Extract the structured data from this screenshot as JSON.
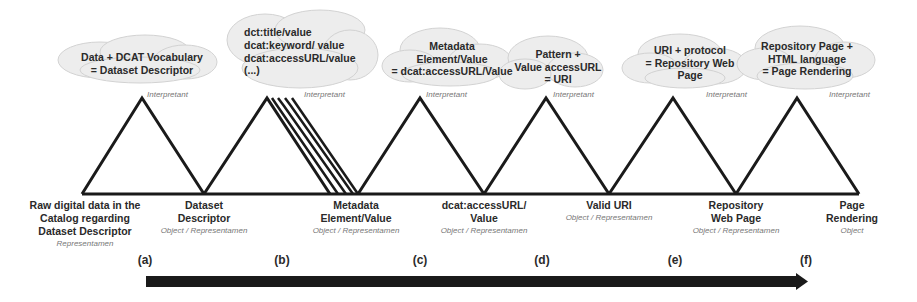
{
  "diagram": {
    "type": "semiotic-chain",
    "interpretant_label": "Interpretant",
    "clouds": [
      {
        "id": "a",
        "lines": [
          "Data + DCAT Vocabulary",
          "= Dataset Descriptor"
        ]
      },
      {
        "id": "b",
        "lines": [
          "dct:title/value",
          "dcat:keyword/ value",
          "dcat:accessURL/value",
          " (...)"
        ]
      },
      {
        "id": "c",
        "lines": [
          "Metadata",
          "Element/Value",
          "= dcat:accessURL/Value"
        ]
      },
      {
        "id": "d",
        "lines": [
          "Pattern +",
          "Value accessURL",
          "= URI"
        ]
      },
      {
        "id": "e",
        "lines": [
          "URI + protocol",
          "= Repository Web",
          "Page"
        ]
      },
      {
        "id": "f",
        "lines": [
          "Repository Page +",
          "HTML language",
          "= Page Rendering"
        ]
      }
    ],
    "nodes": [
      {
        "lines": [
          "Raw digital data in the",
          "Catalog regarding",
          "Dataset Descriptor"
        ],
        "role": "Representamen"
      },
      {
        "lines": [
          "Dataset",
          "Descriptor"
        ],
        "role": "Object / Representamen"
      },
      {
        "lines": [
          "Metadata",
          "Element/Value"
        ],
        "role": "Object / Representamen"
      },
      {
        "lines": [
          "dcat:accessURL/",
          "Value"
        ],
        "role": "Object / Representamen"
      },
      {
        "lines": [
          "Valid URI"
        ],
        "role": "Object / Representamen"
      },
      {
        "lines": [
          "Repository",
          "Web Page"
        ],
        "role": "Object / Representamen"
      },
      {
        "lines": [
          "Page",
          "Rendering"
        ],
        "role": "Object"
      }
    ],
    "steps": [
      "(a)",
      "(b)",
      "(c)",
      "(d)",
      "(e)",
      "(f)"
    ],
    "colors": {
      "line": "#1a1a1a",
      "cloud_fill": "#ececec",
      "cloud_stroke": "#d0d0d0",
      "role_text": "#777777"
    }
  }
}
